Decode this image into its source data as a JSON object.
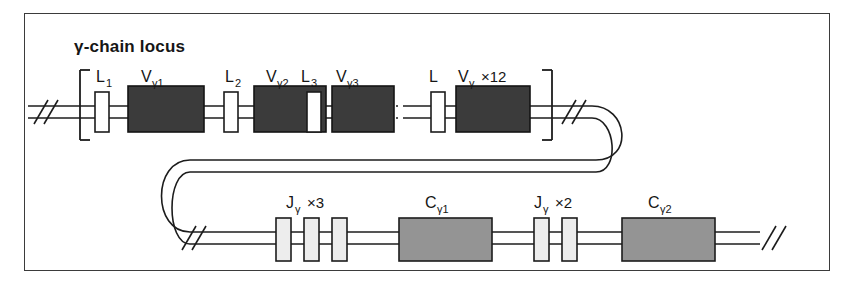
{
  "figure": {
    "title": "γ-chain locus",
    "border_color": "#3b3b3b",
    "background": "#ffffff"
  },
  "colors": {
    "v_gene_fill": "#3b3b3b",
    "c_gene_fill": "#949494",
    "j_gene_fill": "#ededed",
    "l_exon_fill": "#ffffff",
    "line": "#1c1c1c",
    "text": "#161616"
  },
  "top_row": {
    "bracket": "[ ]",
    "left_break_symbol": "//",
    "right_break_symbol": "//",
    "ellipsis": "·····",
    "segments": [
      {
        "name": "L-exon-1",
        "kind": "leader",
        "label": "L",
        "sub": "1",
        "mult": ""
      },
      {
        "name": "V-gamma-1",
        "kind": "v_gene",
        "label": "V",
        "sub": "γ1",
        "mult": ""
      },
      {
        "name": "L-exon-2",
        "kind": "leader",
        "label": "L",
        "sub": "2",
        "mult": ""
      },
      {
        "name": "V-gamma-2",
        "kind": "v_gene",
        "label": "V",
        "sub": "γ2",
        "mult": ""
      },
      {
        "name": "L-exon-3",
        "kind": "leader",
        "label": "L",
        "sub": "3",
        "mult": ""
      },
      {
        "name": "V-gamma-3",
        "kind": "v_gene",
        "label": "V",
        "sub": "γ3",
        "mult": ""
      },
      {
        "name": "L-exon-n",
        "kind": "leader",
        "label": "L",
        "sub": "",
        "mult": ""
      },
      {
        "name": "V-gamma-n",
        "kind": "v_gene",
        "label": "V",
        "sub": "γ",
        "mult": "×12"
      }
    ]
  },
  "bottom_row": {
    "left_break_symbol": "//",
    "right_break_symbol": "//",
    "groups": [
      {
        "name": "J-gamma-cluster-1",
        "label": "J",
        "sub": "γ",
        "mult": "×3",
        "kind": "j_gene",
        "count": 3
      },
      {
        "name": "C-gamma-1",
        "label": "C",
        "sub": "γ1",
        "mult": "",
        "kind": "c_gene",
        "count": 1
      },
      {
        "name": "J-gamma-cluster-2",
        "label": "J",
        "sub": "γ",
        "mult": "×2",
        "kind": "j_gene",
        "count": 2
      },
      {
        "name": "C-gamma-2",
        "label": "C",
        "sub": "γ2",
        "mult": "",
        "kind": "c_gene",
        "count": 1
      }
    ]
  }
}
